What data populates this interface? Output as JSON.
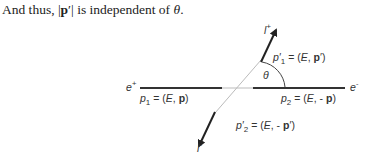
{
  "caption": {
    "prefix": "And thus, |",
    "bold": "p",
    "prime_suffix": "′| is independent of ",
    "theta": "θ",
    "end": "."
  },
  "diagram": {
    "particles": {
      "e_plus": "e",
      "e_plus_sup": "+",
      "e_minus": "e",
      "e_minus_sup": "-",
      "l_plus": "l",
      "l_plus_sup": "+",
      "l_minus": "l",
      "l_minus_sup": "-"
    },
    "angle_label": "θ",
    "momenta": {
      "p1": {
        "name": "p",
        "sub": "1",
        "eq": " = (",
        "E": "E",
        "comma": ", ",
        "vec": "p",
        "close": ")"
      },
      "p2": {
        "name": "p",
        "sub": "2",
        "eq": " = (",
        "E": "E",
        "comma": ", - ",
        "vec": "p",
        "close": ")"
      },
      "p1prime": {
        "name": "p′",
        "sub": "1",
        "eq": " = (",
        "E": "E",
        "comma": ", ",
        "vec": "p",
        "close": "′)"
      },
      "p2prime": {
        "name": "p′",
        "sub": "2",
        "eq": " = (",
        "E": "E",
        "comma": ", - ",
        "vec": "p",
        "close": "′)"
      }
    },
    "colors": {
      "line_dark": "#333333",
      "line_light": "#bbbbbb"
    }
  }
}
